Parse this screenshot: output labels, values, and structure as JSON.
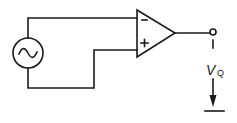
{
  "diagram": {
    "type": "circuit-schematic",
    "components": {
      "source": {
        "kind": "ac-voltage-source",
        "symbol": "~"
      },
      "opamp": {
        "kind": "operational-amplifier",
        "inverting_label": "−",
        "noninverting_label": "+"
      },
      "output": {
        "kind": "output-terminal",
        "label": "V",
        "subscript": "Q"
      },
      "ground": {
        "kind": "ground-reference"
      }
    },
    "colors": {
      "line": "#1a1a1a",
      "background": "#ffffff"
    }
  }
}
